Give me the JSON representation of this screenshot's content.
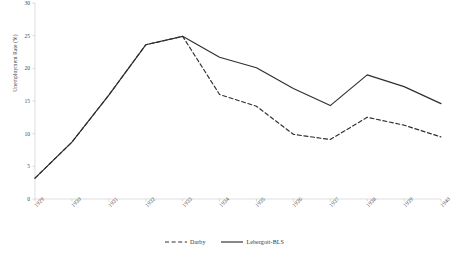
{
  "chart_data": {
    "type": "line",
    "title": "",
    "xlabel": "",
    "ylabel": "Unemployment Rate (%)",
    "ylim": [
      0,
      30
    ],
    "yticks": [
      0,
      5,
      10,
      15,
      20,
      25,
      30
    ],
    "grid": false,
    "legend_position": "bottom",
    "categories": [
      "1929",
      "1930",
      "1931",
      "1932",
      "1933",
      "1934",
      "1935",
      "1936",
      "1937",
      "1938",
      "1939",
      "1940"
    ],
    "series": [
      {
        "name": "Darby",
        "style": "dashed",
        "color": "#2f2f2f",
        "values": [
          3.2,
          8.7,
          15.9,
          23.6,
          24.9,
          16.0,
          14.2,
          9.9,
          9.1,
          12.5,
          11.3,
          9.5
        ]
      },
      {
        "name": "Lebergott-BLS",
        "style": "solid",
        "color": "#2f2f2f",
        "values": [
          3.2,
          8.7,
          15.9,
          23.6,
          24.9,
          21.7,
          20.1,
          16.9,
          14.3,
          19.0,
          17.2,
          14.6
        ]
      }
    ]
  },
  "axis": {
    "y_title": "Unemployment Rate (%)"
  },
  "legend": {
    "items": [
      {
        "label": "Darby",
        "style": "dashed"
      },
      {
        "label": "Lebergott-BLS",
        "style": "solid"
      }
    ]
  }
}
